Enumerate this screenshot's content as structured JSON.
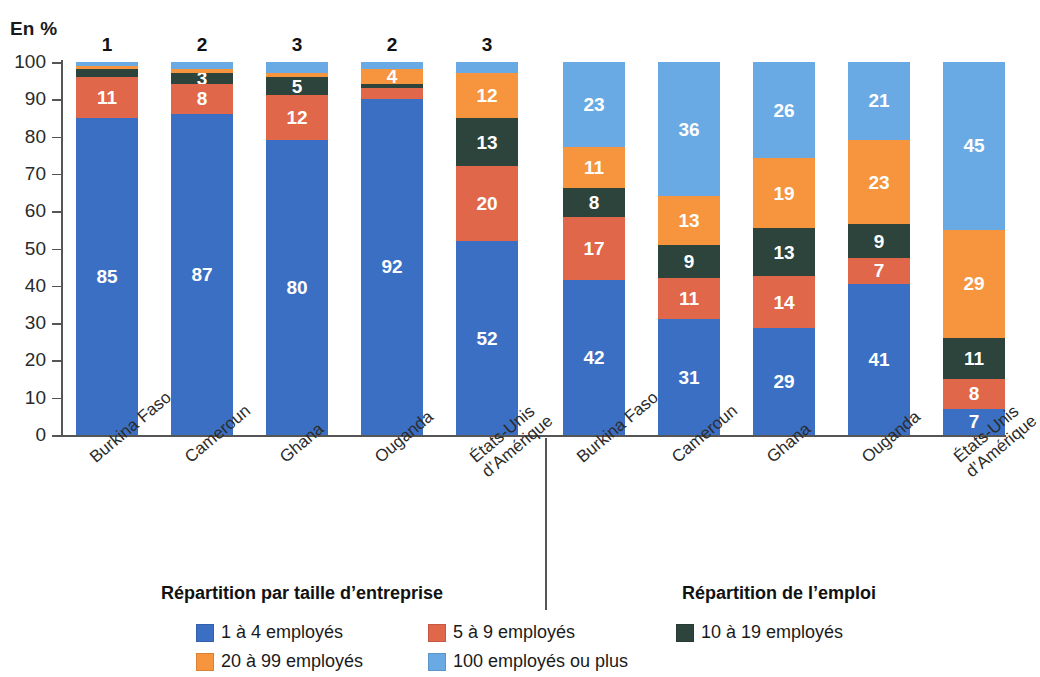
{
  "unit_label": "En %",
  "panels": {
    "left_title": "Répartition par taille d’entreprise",
    "right_title": "Répartition de l’emploi"
  },
  "legend": {
    "items": [
      {
        "label": "1 à 4 employés",
        "color": "#3b6fc4",
        "key": "1-4"
      },
      {
        "label": "5 à 9 employés",
        "color": "#e0674a",
        "key": "5-9"
      },
      {
        "label": "10 à 19 employés",
        "color": "#2c443c",
        "key": "10-19"
      },
      {
        "label": "20 à 99 employés",
        "color": "#f7943e",
        "key": "20-99"
      },
      {
        "label": "100 employés ou plus",
        "color": "#6aaae4",
        "key": "100+"
      }
    ]
  },
  "chart_data": {
    "type": "bar",
    "title": "",
    "subtitle": "",
    "xlabel": "",
    "ylabel": "En %",
    "ylim": [
      0,
      100
    ],
    "yticks": [
      0,
      10,
      20,
      30,
      40,
      50,
      60,
      70,
      80,
      90,
      100
    ],
    "grid": false,
    "stacked": true,
    "stack_order_bottom_to_top": [
      "1 à 4 employés",
      "5 à 9 employés",
      "10 à 19 employés",
      "20 à 99 employés",
      "100 employés ou plus"
    ],
    "legend_position": "bottom",
    "series": [
      {
        "name": "1 à 4 employés",
        "color": "#3b6fc4",
        "values": [
          85,
          87,
          80,
          92,
          52,
          42,
          31,
          29,
          41,
          7
        ]
      },
      {
        "name": "5 à 9 employés",
        "color": "#e0674a",
        "values": [
          11,
          8,
          12,
          3,
          20,
          17,
          11,
          14,
          7,
          8
        ]
      },
      {
        "name": "10 à 19 employés",
        "color": "#2c443c",
        "values": [
          2,
          3,
          5,
          1,
          13,
          8,
          9,
          13,
          9,
          11
        ]
      },
      {
        "name": "20 à 99 employés",
        "color": "#f7943e",
        "values": [
          1,
          1,
          1,
          4,
          12,
          11,
          13,
          19,
          23,
          29
        ]
      },
      {
        "name": "100 employés ou plus",
        "color": "#6aaae4",
        "values": [
          1,
          2,
          3,
          2,
          3,
          23,
          36,
          26,
          21,
          45
        ]
      }
    ],
    "categories": [
      "Burkina Faso",
      "Cameroun",
      "Ghana",
      "Ouganda",
      "États-Unis\nd’Amérique",
      "Burkina Faso",
      "Cameroun",
      "Ghana",
      "Ouganda",
      "États-Unis\nd’Amérique"
    ],
    "panel_of_category": [
      "left",
      "left",
      "left",
      "left",
      "left",
      "right",
      "right",
      "right",
      "right",
      "right"
    ]
  },
  "bars": [
    {
      "panel": "left",
      "category": "Burkina Faso",
      "x": 76,
      "top_label": "1",
      "segments": [
        {
          "key": "1-4",
          "value": 85,
          "label": "85",
          "color": "#3b6fc4"
        },
        {
          "key": "5-9",
          "value": 11,
          "label": "11",
          "color": "#e0674a"
        },
        {
          "key": "10-19",
          "value": 2,
          "label": "",
          "color": "#2c443c"
        },
        {
          "key": "20-99",
          "value": 1,
          "label": "",
          "color": "#f7943e"
        },
        {
          "key": "100+",
          "value": 1,
          "label": "",
          "color": "#6aaae4"
        }
      ]
    },
    {
      "panel": "left",
      "category": "Cameroun",
      "x": 171,
      "top_label": "2",
      "segments": [
        {
          "key": "1-4",
          "value": 87,
          "label": "87",
          "color": "#3b6fc4"
        },
        {
          "key": "5-9",
          "value": 8,
          "label": "8",
          "color": "#e0674a"
        },
        {
          "key": "10-19",
          "value": 3,
          "label": "3",
          "color": "#2c443c"
        },
        {
          "key": "20-99",
          "value": 1,
          "label": "",
          "color": "#f7943e"
        },
        {
          "key": "100+",
          "value": 2,
          "label": "",
          "color": "#6aaae4"
        }
      ]
    },
    {
      "panel": "left",
      "category": "Ghana",
      "x": 266,
      "top_label": "3",
      "segments": [
        {
          "key": "1-4",
          "value": 80,
          "label": "80",
          "color": "#3b6fc4"
        },
        {
          "key": "5-9",
          "value": 12,
          "label": "12",
          "color": "#e0674a"
        },
        {
          "key": "10-19",
          "value": 5,
          "label": "5",
          "color": "#2c443c"
        },
        {
          "key": "20-99",
          "value": 1,
          "label": "",
          "color": "#f7943e"
        },
        {
          "key": "100+",
          "value": 3,
          "label": "",
          "color": "#6aaae4"
        }
      ]
    },
    {
      "panel": "left",
      "category": "Ouganda",
      "x": 361,
      "top_label": "2",
      "segments": [
        {
          "key": "1-4",
          "value": 92,
          "label": "92",
          "color": "#3b6fc4"
        },
        {
          "key": "5-9",
          "value": 3,
          "label": "",
          "color": "#e0674a"
        },
        {
          "key": "10-19",
          "value": 1,
          "label": "",
          "color": "#2c443c"
        },
        {
          "key": "20-99",
          "value": 4,
          "label": "4",
          "color": "#f7943e"
        },
        {
          "key": "100+",
          "value": 2,
          "label": "",
          "color": "#6aaae4"
        }
      ]
    },
    {
      "panel": "left",
      "category": "États-Unis d’Amérique",
      "x": 456,
      "top_label": "3",
      "segments": [
        {
          "key": "1-4",
          "value": 52,
          "label": "52",
          "color": "#3b6fc4"
        },
        {
          "key": "5-9",
          "value": 20,
          "label": "20",
          "color": "#e0674a"
        },
        {
          "key": "10-19",
          "value": 13,
          "label": "13",
          "color": "#2c443c"
        },
        {
          "key": "20-99",
          "value": 12,
          "label": "12",
          "color": "#f7943e"
        },
        {
          "key": "100+",
          "value": 3,
          "label": "",
          "color": "#6aaae4"
        }
      ]
    },
    {
      "panel": "right",
      "category": "Burkina Faso",
      "x": 563,
      "top_label": "",
      "segments": [
        {
          "key": "1-4",
          "value": 42,
          "label": "42",
          "color": "#3b6fc4"
        },
        {
          "key": "5-9",
          "value": 17,
          "label": "17",
          "color": "#e0674a"
        },
        {
          "key": "10-19",
          "value": 8,
          "label": "8",
          "color": "#2c443c"
        },
        {
          "key": "20-99",
          "value": 11,
          "label": "11",
          "color": "#f7943e"
        },
        {
          "key": "100+",
          "value": 23,
          "label": "23",
          "color": "#6aaae4"
        }
      ]
    },
    {
      "panel": "right",
      "category": "Cameroun",
      "x": 658,
      "top_label": "",
      "segments": [
        {
          "key": "1-4",
          "value": 31,
          "label": "31",
          "color": "#3b6fc4"
        },
        {
          "key": "5-9",
          "value": 11,
          "label": "11",
          "color": "#e0674a"
        },
        {
          "key": "10-19",
          "value": 9,
          "label": "9",
          "color": "#2c443c"
        },
        {
          "key": "20-99",
          "value": 13,
          "label": "13",
          "color": "#f7943e"
        },
        {
          "key": "100+",
          "value": 36,
          "label": "36",
          "color": "#6aaae4"
        }
      ]
    },
    {
      "panel": "right",
      "category": "Ghana",
      "x": 753,
      "top_label": "",
      "segments": [
        {
          "key": "1-4",
          "value": 29,
          "label": "29",
          "color": "#3b6fc4"
        },
        {
          "key": "5-9",
          "value": 14,
          "label": "14",
          "color": "#e0674a"
        },
        {
          "key": "10-19",
          "value": 13,
          "label": "13",
          "color": "#2c443c"
        },
        {
          "key": "20-99",
          "value": 19,
          "label": "19",
          "color": "#f7943e"
        },
        {
          "key": "100+",
          "value": 26,
          "label": "26",
          "color": "#6aaae4"
        }
      ]
    },
    {
      "panel": "right",
      "category": "Ouganda",
      "x": 848,
      "top_label": "",
      "segments": [
        {
          "key": "1-4",
          "value": 41,
          "label": "41",
          "color": "#3b6fc4"
        },
        {
          "key": "5-9",
          "value": 7,
          "label": "7",
          "color": "#e0674a"
        },
        {
          "key": "10-19",
          "value": 9,
          "label": "9",
          "color": "#2c443c"
        },
        {
          "key": "20-99",
          "value": 23,
          "label": "23",
          "color": "#f7943e"
        },
        {
          "key": "100+",
          "value": 21,
          "label": "21",
          "color": "#6aaae4"
        }
      ]
    },
    {
      "panel": "right",
      "category": "États-Unis d’Amérique",
      "x": 943,
      "top_label": "",
      "segments": [
        {
          "key": "1-4",
          "value": 7,
          "label": "7",
          "color": "#3b6fc4"
        },
        {
          "key": "5-9",
          "value": 8,
          "label": "8",
          "color": "#e0674a"
        },
        {
          "key": "10-19",
          "value": 11,
          "label": "11",
          "color": "#2c443c"
        },
        {
          "key": "20-99",
          "value": 29,
          "label": "29",
          "color": "#f7943e"
        },
        {
          "key": "100+",
          "value": 45,
          "label": "45",
          "color": "#6aaae4"
        }
      ]
    }
  ],
  "x_axis_labels": [
    {
      "text": "Burkina Faso",
      "x": 86,
      "y": 452
    },
    {
      "text": "Cameroun",
      "x": 181,
      "y": 452
    },
    {
      "text": "Ghana",
      "x": 276,
      "y": 452
    },
    {
      "text": "Ouganda",
      "x": 371,
      "y": 452
    },
    {
      "text": "États-Unis\nd’Amérique",
      "x": 466,
      "y": 452
    },
    {
      "text": "Burkina Faso",
      "x": 573,
      "y": 452
    },
    {
      "text": "Cameroun",
      "x": 668,
      "y": 452
    },
    {
      "text": "Ghana",
      "x": 763,
      "y": 452
    },
    {
      "text": "Ouganda",
      "x": 858,
      "y": 452
    },
    {
      "text": "États-Unis\nd’Amérique",
      "x": 950,
      "y": 452
    }
  ]
}
